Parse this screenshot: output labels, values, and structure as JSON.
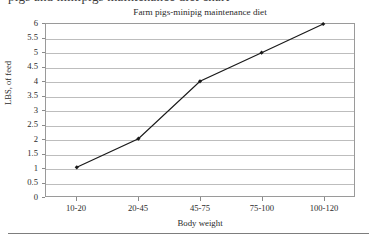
{
  "page": {
    "clipped_caption_top": "pigs and minipigs maintenance diet chart"
  },
  "chart_data": {
    "type": "line",
    "title": "Farm pigs-minipig maintenance diet",
    "xlabel": "Body weight",
    "ylabel": "LBS, of feed",
    "categories": [
      "10-20",
      "20-45",
      "45-75",
      "75-100",
      "100-120"
    ],
    "values": [
      1,
      2,
      4,
      5,
      6
    ],
    "ylim": [
      0,
      6
    ],
    "ytick_step": 0.5,
    "yticks": [
      "6",
      "5.5",
      "5",
      "4.5",
      "4",
      "3.5",
      "3",
      "2.5",
      "2",
      "1.5",
      "1",
      "0.5",
      "0"
    ],
    "grid": true,
    "legend": "none",
    "series_color": "#1a1a1a",
    "gridline_color": "#bdbdbd",
    "marker": "diamond"
  }
}
